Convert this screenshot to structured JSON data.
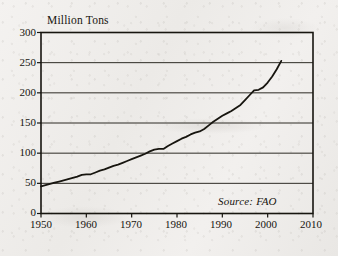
{
  "figure": {
    "background_color": "#efedeb",
    "ink_color": "#17150f",
    "axis_title_y": "Million Tons",
    "source_note": "Source: FAO"
  },
  "chart_data": {
    "type": "line",
    "title": "",
    "subtitle": "",
    "xlabel": "",
    "ylabel": "Million Tons",
    "xlim": [
      1950,
      2010
    ],
    "ylim": [
      0,
      300
    ],
    "xticks": [
      1950,
      1960,
      1970,
      1980,
      1990,
      2000,
      2010
    ],
    "yticks": [
      0,
      50,
      100,
      150,
      200,
      250,
      300
    ],
    "xtick_labels": [
      "1950",
      "1960",
      "1970",
      "1980",
      "1990",
      "2000",
      "2010"
    ],
    "ytick_labels": [
      "0",
      "50",
      "100",
      "150",
      "200",
      "250",
      "300"
    ],
    "grid": "horizontal",
    "legend": "none",
    "annotations": [
      {
        "text": "Source: FAO",
        "x": 2000,
        "y": 18,
        "style": "italic"
      }
    ],
    "series": [
      {
        "name": "World meat production",
        "color": "#17150f",
        "line_width": 1.8,
        "x": [
          1950,
          1951,
          1952,
          1953,
          1954,
          1955,
          1956,
          1957,
          1958,
          1959,
          1960,
          1961,
          1962,
          1963,
          1964,
          1965,
          1966,
          1967,
          1968,
          1969,
          1970,
          1971,
          1972,
          1973,
          1974,
          1975,
          1976,
          1977,
          1978,
          1979,
          1980,
          1981,
          1982,
          1983,
          1984,
          1985,
          1986,
          1987,
          1988,
          1989,
          1990,
          1991,
          1992,
          1993,
          1994,
          1995,
          1996,
          1997,
          1998,
          1999,
          2000,
          2001,
          2002,
          2003
        ],
        "values": [
          45,
          47,
          49,
          51,
          53,
          55,
          57,
          59,
          61,
          64,
          65,
          65,
          68,
          71,
          73,
          76,
          79,
          81,
          84,
          87,
          90,
          93,
          96,
          99,
          103,
          106,
          107,
          107,
          112,
          116,
          120,
          124,
          127,
          131,
          134,
          136,
          140,
          146,
          152,
          157,
          162,
          166,
          170,
          175,
          180,
          188,
          196,
          204,
          205,
          209,
          217,
          227,
          239,
          253
        ],
        "units": "million tons"
      }
    ]
  }
}
